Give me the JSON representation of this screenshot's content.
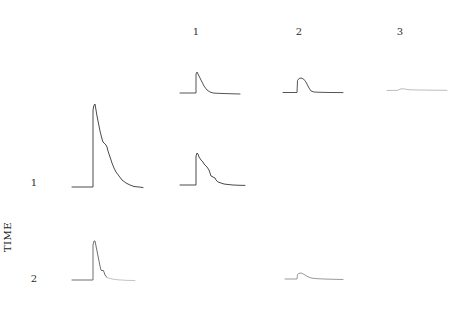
{
  "figure": {
    "column_labels": [
      "1",
      "2",
      "3"
    ],
    "row_labels": [
      "1",
      "2"
    ],
    "axis_label": "TIME"
  },
  "colors": {
    "background": "#ffffff",
    "label_text": "#2e2e2e",
    "trace_dark": "#4a4a4a",
    "trace_medium": "#6f6f6f",
    "trace_light": "#9a9a9a",
    "trace_faint": "#bdbdbd"
  },
  "chart_data": {
    "type": "line",
    "title": "",
    "xlabel": "",
    "ylabel": "TIME",
    "legend": "none",
    "grid": false,
    "axes_drawn": false,
    "coordinate_space": "pixels, y increases downward, canvas 474x319",
    "columns": [
      "1",
      "2",
      "3"
    ],
    "rows": [
      "1",
      "2"
    ],
    "series": [
      {
        "name": "trace-top-col1",
        "row": "top",
        "column": "1",
        "color": "#555555",
        "stroke_width": 1,
        "points": [
          [
            180,
            93
          ],
          [
            190,
            93
          ],
          [
            196,
            93
          ],
          [
            196,
            74
          ],
          [
            197,
            72
          ],
          [
            198,
            74
          ],
          [
            200,
            78
          ],
          [
            202,
            82
          ],
          [
            204,
            86
          ],
          [
            207,
            90
          ],
          [
            210,
            92
          ],
          [
            213,
            93
          ],
          [
            218,
            93.3
          ],
          [
            226,
            93.6
          ],
          [
            233,
            93.8
          ],
          [
            240,
            94
          ]
        ]
      },
      {
        "name": "trace-top-col2",
        "row": "top",
        "column": "2",
        "color": "#555555",
        "stroke_width": 1,
        "points": [
          [
            283,
            92.5
          ],
          [
            290,
            92.5
          ],
          [
            297,
            92.5
          ],
          [
            297.5,
            80.5
          ],
          [
            299,
            78.5
          ],
          [
            301,
            78
          ],
          [
            303,
            78.8
          ],
          [
            305,
            80.5
          ],
          [
            307,
            84
          ],
          [
            309,
            88
          ],
          [
            311,
            91
          ],
          [
            314,
            92
          ],
          [
            320,
            92.3
          ],
          [
            330,
            92.5
          ],
          [
            343,
            92.6
          ]
        ]
      },
      {
        "name": "trace-top-col3",
        "row": "top",
        "column": "3",
        "color": "#bdbdbd",
        "stroke_width": 1,
        "points": [
          [
            387,
            90.5
          ],
          [
            394,
            90.4
          ],
          [
            398,
            90.3
          ],
          [
            400,
            89.1
          ],
          [
            403,
            88.7
          ],
          [
            406,
            89.3
          ],
          [
            410,
            89.8
          ],
          [
            420,
            90
          ],
          [
            432,
            90.2
          ],
          [
            447,
            90.3
          ]
        ]
      },
      {
        "name": "trace-row1-reference",
        "row": "1",
        "column": "reference",
        "color": "#4a4a4a",
        "stroke_width": 1,
        "points": [
          [
            72,
            187
          ],
          [
            82,
            187
          ],
          [
            93,
            187
          ],
          [
            93,
            110
          ],
          [
            94,
            105
          ],
          [
            95,
            104
          ],
          [
            96,
            110
          ],
          [
            97,
            116
          ],
          [
            98,
            121
          ],
          [
            99,
            126
          ],
          [
            100,
            131
          ],
          [
            101,
            135
          ],
          [
            102,
            139
          ],
          [
            103,
            142
          ],
          [
            105,
            144
          ],
          [
            106,
            145
          ],
          [
            107,
            147
          ],
          [
            108,
            151
          ],
          [
            110,
            157
          ],
          [
            112,
            163
          ],
          [
            114,
            168
          ],
          [
            116,
            172
          ],
          [
            119,
            176
          ],
          [
            122,
            180
          ],
          [
            126,
            183
          ],
          [
            130,
            185
          ],
          [
            134,
            186.5
          ],
          [
            139,
            187
          ],
          [
            143,
            187.5
          ]
        ]
      },
      {
        "name": "trace-row1-col1",
        "row": "1",
        "column": "1",
        "color": "#4a4a4a",
        "stroke_width": 1,
        "points": [
          [
            180,
            185
          ],
          [
            188,
            185
          ],
          [
            196,
            185
          ],
          [
            196,
            156
          ],
          [
            197,
            153
          ],
          [
            198,
            154
          ],
          [
            199,
            157
          ],
          [
            201,
            160
          ],
          [
            203,
            162
          ],
          [
            204,
            164
          ],
          [
            206,
            166
          ],
          [
            207,
            167
          ],
          [
            209,
            170
          ],
          [
            210,
            173
          ],
          [
            211,
            176
          ],
          [
            213,
            177
          ],
          [
            215,
            178
          ],
          [
            216,
            180
          ],
          [
            218,
            182
          ],
          [
            221,
            183
          ],
          [
            224,
            184
          ],
          [
            228,
            184.5
          ],
          [
            233,
            185
          ],
          [
            240,
            185.3
          ],
          [
            245,
            185.4
          ]
        ]
      },
      {
        "name": "trace-row2-reference",
        "row": "2",
        "column": "reference",
        "color": "#6f6f6f",
        "stroke_width": 1,
        "points": [
          [
            72,
            280
          ],
          [
            82,
            280
          ],
          [
            93,
            280
          ],
          [
            93,
            245
          ],
          [
            94,
            241
          ],
          [
            95,
            241
          ],
          [
            96,
            246
          ],
          [
            97,
            251
          ],
          [
            98,
            256
          ],
          [
            99,
            261
          ],
          [
            100,
            266
          ],
          [
            101,
            270
          ],
          [
            102,
            271
          ],
          [
            103,
            270
          ],
          [
            104,
            272
          ],
          [
            105,
            275
          ],
          [
            107,
            277.5
          ]
        ]
      },
      {
        "name": "trace-row2-reference-tail",
        "row": "2",
        "column": "reference",
        "color": "#c4c4c4",
        "stroke_width": 1,
        "points": [
          [
            107,
            277.5
          ],
          [
            112,
            279
          ],
          [
            118,
            279.8
          ],
          [
            126,
            280.3
          ],
          [
            135,
            280.6
          ]
        ]
      },
      {
        "name": "trace-row2-col2",
        "row": "2",
        "column": "2",
        "color": "#9a9a9a",
        "stroke_width": 1,
        "points": [
          [
            285,
            279
          ],
          [
            291,
            279
          ],
          [
            297,
            279
          ],
          [
            297.5,
            274.5
          ],
          [
            299,
            273.3
          ],
          [
            301,
            273
          ],
          [
            303,
            273.8
          ],
          [
            305,
            275
          ],
          [
            308,
            276.8
          ],
          [
            311,
            278
          ],
          [
            316,
            278.6
          ],
          [
            324,
            279
          ],
          [
            334,
            279.3
          ],
          [
            343,
            279.5
          ]
        ]
      }
    ]
  }
}
